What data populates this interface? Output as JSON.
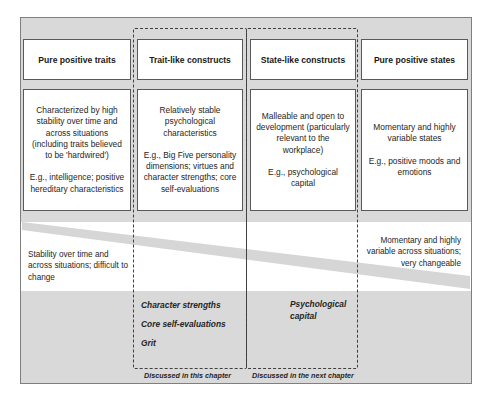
{
  "diagram": {
    "type": "continuum-of-positive-constructs",
    "colors": {
      "frame_fill": "#d9d9d9",
      "frame_border": "#7f7f7f",
      "box_fill": "#ffffff",
      "box_border": "#595959",
      "diagonal_band": "#d9d9d9",
      "dashed_border": "#3f3f3f"
    },
    "columns": [
      {
        "header": "Pure positive traits",
        "description": "Characterized by high stability over time and across situations (including traits believed to be 'hardwired')",
        "examples": "E.g., intelligence; positive hereditary characteristics"
      },
      {
        "header": "Trait-like constructs",
        "description": "Relatively stable psychological characteristics",
        "examples": "E.g., Big Five personality dimensions; virtues and character strengths; core self-evaluations"
      },
      {
        "header": "State-like constructs",
        "description": "Malleable and open to development (particularly relevant to the workplace)",
        "examples": "E.g., psychological capital"
      },
      {
        "header": "Pure positive states",
        "description": "Momentary and highly variable states",
        "examples": "E.g., positive moods and emotions"
      }
    ],
    "continuum": {
      "left_label": "Stability over time and across situations; difficult to change",
      "right_label": "Momentary and highly variable across situations; very changeable"
    },
    "groups": [
      {
        "items": [
          "Character strengths",
          "Core self-evaluations",
          "Grit"
        ],
        "caption": "Discussed in this chapter"
      },
      {
        "items": [
          "Psychological capital"
        ],
        "caption": "Discussed in the next chapter"
      }
    ]
  }
}
